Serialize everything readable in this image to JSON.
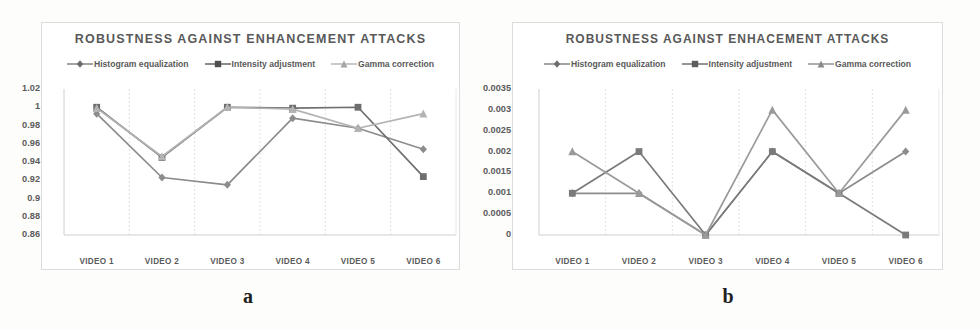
{
  "figure": {
    "captions": {
      "a": "a",
      "b": "b"
    }
  },
  "panel_a": {
    "title": "ROBUSTNESS AGAINST ENHANCEMENT ATTACKS",
    "legend": [
      {
        "label": "Histogram equalization",
        "marker": "diamond-marker-icon",
        "color": "#8c8c8c"
      },
      {
        "label": "Intensity adjustment",
        "marker": "square-marker-icon",
        "color": "#6e6e6e"
      },
      {
        "label": "Gamma correction",
        "marker": "triangle-marker-icon",
        "color": "#b3b3b3"
      }
    ]
  },
  "panel_b": {
    "title": "ROBUSTNESS AGAINST ENHACEMENT ATTACKS",
    "legend": [
      {
        "label": "Histogram equalization",
        "marker": "diamond-marker-icon",
        "color": "#8c8c8c"
      },
      {
        "label": "Intensity adjustment",
        "marker": "square-marker-icon",
        "color": "#7a7a7a"
      },
      {
        "label": "Gamma correction",
        "marker": "triangle-marker-icon",
        "color": "#9a9a9a"
      }
    ]
  },
  "chart_data": [
    {
      "id": "a",
      "type": "line",
      "title": "ROBUSTNESS AGAINST ENHANCEMENT ATTACKS",
      "xlabel": "",
      "ylabel": "",
      "categories": [
        "VIDEO 1",
        "VIDEO 2",
        "VIDEO 3",
        "VIDEO 4",
        "VIDEO 5",
        "VIDEO 6"
      ],
      "yticks": [
        1.02,
        1,
        0.98,
        0.96,
        0.94,
        0.92,
        0.9,
        0.88,
        0.86
      ],
      "ytick_labels": [
        "1.02",
        "1",
        "0.98",
        "0.96",
        "0.94",
        "0.92",
        "0.9",
        "0.88",
        "0.86"
      ],
      "ylim": [
        0.86,
        1.02
      ],
      "grid": "vertical",
      "legend_position": "top",
      "series": [
        {
          "name": "Histogram equalization",
          "marker": "diamond",
          "color": "#8c8c8c",
          "values": [
            0.993,
            0.923,
            0.915,
            0.988,
            0.977,
            0.954
          ]
        },
        {
          "name": "Intensity adjustment",
          "marker": "square",
          "color": "#6e6e6e",
          "values": [
            1.0,
            0.945,
            1.0,
            0.999,
            1.0,
            0.924
          ]
        },
        {
          "name": "Gamma correction",
          "marker": "triangle",
          "color": "#b3b3b3",
          "values": [
            0.999,
            0.946,
            1.0,
            0.998,
            0.977,
            0.993
          ]
        }
      ]
    },
    {
      "id": "b",
      "type": "line",
      "title": "ROBUSTNESS AGAINST ENHACEMENT ATTACKS",
      "xlabel": "",
      "ylabel": "",
      "categories": [
        "VIDEO 1",
        "VIDEO 2",
        "VIDEO 3",
        "VIDEO 4",
        "VIDEO 5",
        "VIDEO 6"
      ],
      "yticks": [
        0.0035,
        0.003,
        0.0025,
        0.002,
        0.0015,
        0.001,
        0.0005,
        0
      ],
      "ytick_labels": [
        "0.0035",
        "0.003",
        "0.0025",
        "0.002",
        "0.0015",
        "0.001",
        "0.0005",
        "0"
      ],
      "ylim": [
        0,
        0.0035
      ],
      "grid": "vertical",
      "legend_position": "top",
      "series": [
        {
          "name": "Histogram equalization",
          "marker": "diamond",
          "color": "#8c8c8c",
          "values": [
            0.001,
            0.001,
            0,
            0.002,
            0.001,
            0.002
          ]
        },
        {
          "name": "Intensity adjustment",
          "marker": "square",
          "color": "#7a7a7a",
          "values": [
            0.001,
            0.002,
            0,
            0.002,
            0.001,
            0
          ]
        },
        {
          "name": "Gamma correction",
          "marker": "triangle",
          "color": "#9a9a9a",
          "values": [
            0.002,
            0.001,
            0,
            0.003,
            0.001,
            0.003
          ]
        }
      ]
    }
  ]
}
